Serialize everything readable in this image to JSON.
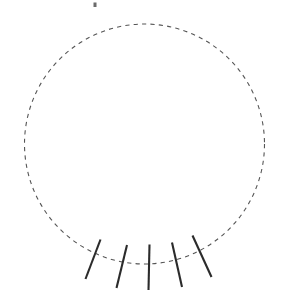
{
  "canvas": {
    "width": 283,
    "height": 302,
    "background": "#ffffff",
    "title": "Dashed circle with five tangential hatch marks on lower arc"
  },
  "palette": {
    "circle_stroke": "#555555",
    "tick_stroke": "#2b2b2b",
    "speck_fill": "#6b6b6b",
    "background": "#ffffff"
  },
  "circle": {
    "label": "dashed-circle",
    "center_x": 144.5,
    "center_y": 144,
    "radius": 120,
    "stroke": "#555555",
    "stroke_width": 1.1,
    "dash_length": 4.2,
    "gap_length": 4.2,
    "fill": "none"
  },
  "ticks": {
    "label": "hatch-marks",
    "count": 5,
    "stroke": "#2b2b2b",
    "stroke_width": 2.1,
    "items": [
      {
        "id": "tick-1",
        "x1": 100.5,
        "y1": 239.5,
        "x2": 85.5,
        "y2": 279.0
      },
      {
        "id": "tick-2",
        "x1": 127.0,
        "y1": 245.0,
        "x2": 116.5,
        "y2": 288.0
      },
      {
        "id": "tick-3",
        "x1": 149.5,
        "y1": 244.5,
        "x2": 148.5,
        "y2": 290.0
      },
      {
        "id": "tick-4",
        "x1": 172.0,
        "y1": 242.5,
        "x2": 182.0,
        "y2": 287.0
      },
      {
        "id": "tick-5",
        "x1": 192.5,
        "y1": 235.5,
        "x2": 211.5,
        "y2": 277.0
      }
    ]
  },
  "speck": {
    "label": "stray-mark",
    "x": 93.5,
    "y": 2.5,
    "width": 3.0,
    "height": 4.5,
    "fill": "#6b6b6b"
  }
}
